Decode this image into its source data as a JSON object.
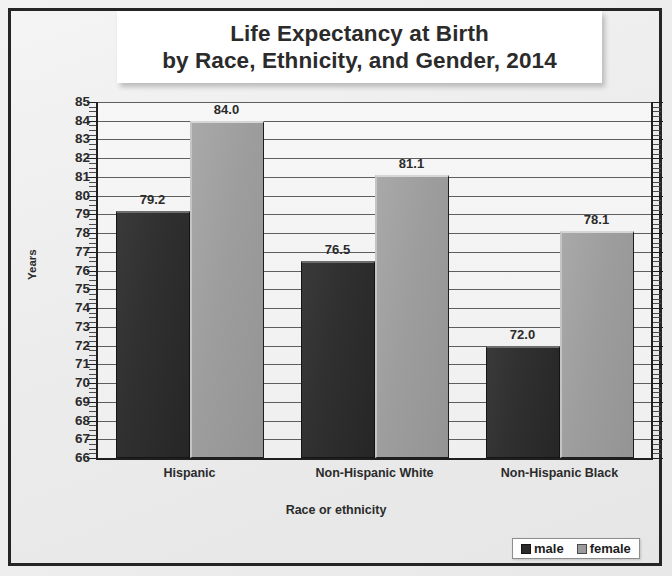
{
  "chart_data": {
    "type": "bar",
    "title": "Life Expectancy at Birth by Race, Ethnicity, and Gender, 2014",
    "title_lines": [
      "Life Expectancy at Birth",
      "by Race, Ethnicity, and Gender, 2014"
    ],
    "categories": [
      "Hispanic",
      "Non-Hispanic White",
      "Non-Hispanic Black"
    ],
    "series": [
      {
        "name": "male",
        "color": "#2b2b2b",
        "values": [
          79.2,
          76.5,
          72.0
        ],
        "labels": [
          "79.2",
          "76.5",
          "72.0"
        ]
      },
      {
        "name": "female",
        "color": "#9b9b9b",
        "values": [
          84.0,
          81.1,
          78.1
        ],
        "labels": [
          "84.0",
          "81.1",
          "78.1"
        ]
      }
    ],
    "xlabel": "Race or ethnicity",
    "ylabel": "Years",
    "ylim": [
      66,
      85
    ],
    "ytick_labels": [
      "85",
      "84",
      "83",
      "82",
      "81",
      "80",
      "79",
      "78",
      "77",
      "76",
      "75",
      "74",
      "73",
      "72",
      "71",
      "70",
      "69",
      "68",
      "67",
      "66"
    ],
    "grid": true,
    "legend_position": "bottom-right",
    "legend_entries": [
      "male",
      "female"
    ]
  }
}
